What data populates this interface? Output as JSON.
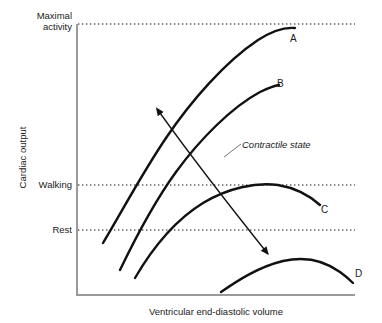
{
  "chart_data": {
    "type": "line",
    "title": "",
    "subtitle": "",
    "xlabel": "Ventricular end-diastolic volume",
    "ylabel": "Cardiac output",
    "grid": false,
    "legend_position": "inline-curve-end-labels",
    "axis_style": "open-box-left-and-bottom-spines",
    "ytick_labels": [
      "Maximal activity",
      "Walking",
      "Rest"
    ],
    "yticks": [
      {
        "label": "Maximal activity",
        "label_line1": "Maximal",
        "label_line2": "activity",
        "pixel_y": 24,
        "gridline": "dotted"
      },
      {
        "label": "Walking",
        "pixel_y": 185,
        "gridline": "dotted"
      },
      {
        "label": "Rest",
        "pixel_y": 230,
        "gridline": "dotted"
      }
    ],
    "xtick_labels": [],
    "axis_ranges": {
      "x_pixel": [
        77,
        355
      ],
      "y_pixel": [
        24,
        295
      ]
    },
    "series": [
      {
        "name": "A",
        "label": "A",
        "description": "Highest contractile state curve, peaks at maximal activity level",
        "path": "M 103,243 C 120,215 141,175 166,138 C 191,101 225,62 258,40 C 272,31 285,27 295,28",
        "label_pixel": [
          295,
          40
        ],
        "values": [
          [
            103,
            243
          ],
          [
            130,
            205
          ],
          [
            160,
            158
          ],
          [
            195,
            110
          ],
          [
            230,
            72
          ],
          [
            258,
            45
          ],
          [
            280,
            30
          ],
          [
            295,
            28
          ]
        ]
      },
      {
        "name": "B",
        "label": "B",
        "description": "Second contractile state curve, plateaus mid-height",
        "path": "M 120,270 C 133,243 152,205 176,172 C 200,139 232,107 260,92 C 268,88 274,86 279,85",
        "label_pixel": [
          281,
          85
        ],
        "values": [
          [
            120,
            270
          ],
          [
            140,
            232
          ],
          [
            165,
            188
          ],
          [
            196,
            145
          ],
          [
            228,
            113
          ],
          [
            253,
            95
          ],
          [
            270,
            87
          ],
          [
            279,
            85
          ]
        ]
      },
      {
        "name": "C",
        "label": "C",
        "description": "Third contractile state curve, peaks near walking level",
        "path": "M 135,278 C 149,254 172,222 203,203 C 228,188 256,182 278,185 C 296,188 310,196 320,205",
        "label_pixel": [
          326,
          211
        ],
        "values": [
          [
            135,
            278
          ],
          [
            155,
            249
          ],
          [
            180,
            223
          ],
          [
            210,
            200
          ],
          [
            243,
            186
          ],
          [
            275,
            184
          ],
          [
            300,
            193
          ],
          [
            320,
            205
          ]
        ]
      },
      {
        "name": "D",
        "label": "D",
        "description": "Lowest contractile state curve, flattest and lowest cardiac output",
        "path": "M 221,292 C 237,281 258,267 283,261 C 305,256 325,261 340,272 C 347,277 351,281 353,283",
        "label_pixel": [
          360,
          275
        ],
        "values": [
          [
            221,
            292
          ],
          [
            245,
            275
          ],
          [
            272,
            263
          ],
          [
            300,
            260
          ],
          [
            325,
            265
          ],
          [
            343,
            275
          ],
          [
            353,
            283
          ]
        ]
      }
    ],
    "annotations": [
      {
        "name": "contractile-state",
        "text": "Contractile state",
        "style": "italic",
        "text_pixel": [
          242,
          139
        ],
        "leader_line": "M 240,145 L 225,156",
        "arrow": {
          "type": "double-headed",
          "from_pixel": [
            159,
            112
          ],
          "to_pixel": [
            269,
            255
          ],
          "meaning": "direction of increasing and decreasing contractile state across curves A to D"
        }
      }
    ]
  },
  "labels": {
    "maximal_line1": "Maximal",
    "maximal_line2": "activity",
    "walking": "Walking",
    "rest": "Rest",
    "y_title": "Cardiac output",
    "x_title": "Ventricular end-diastolic volume",
    "contractile": "Contractile state",
    "curve_a": "A",
    "curve_b": "B",
    "curve_c": "C",
    "curve_d": "D"
  },
  "colors": {
    "curve": "#111111",
    "axis": "#9a9a9a",
    "dotted": "#111111",
    "text": "#1a1a1a",
    "background": "#ffffff"
  }
}
